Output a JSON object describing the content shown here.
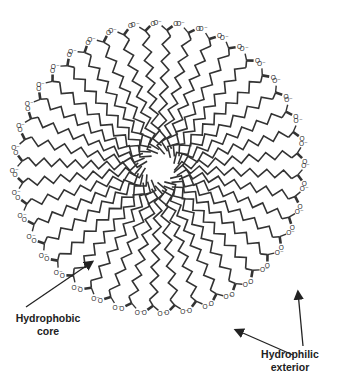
{
  "diagram": {
    "center": [
      160,
      168
    ],
    "chain_count": 40,
    "inner_radius": 14,
    "head_radius": 148,
    "zigzag_amplitude": 4,
    "zigzag_segments": 14,
    "stroke_color": "#333333",
    "head_group": {
      "carbonyl": "O",
      "anion": "O⁻"
    },
    "labels": {
      "core": {
        "line1": "Hydrophobic",
        "line2": "core"
      },
      "exterior": {
        "line1": "Hydrophilic",
        "line2": "exterior"
      }
    },
    "arrows": [
      {
        "name": "core-arrow",
        "from": [
          26,
          307
        ],
        "to": [
          92,
          262
        ]
      },
      {
        "name": "exterior-arrow-left",
        "from": [
          293,
          355
        ],
        "to": [
          236,
          330
        ]
      },
      {
        "name": "exterior-arrow-up",
        "from": [
          303,
          346
        ],
        "to": [
          298,
          292
        ]
      }
    ]
  }
}
